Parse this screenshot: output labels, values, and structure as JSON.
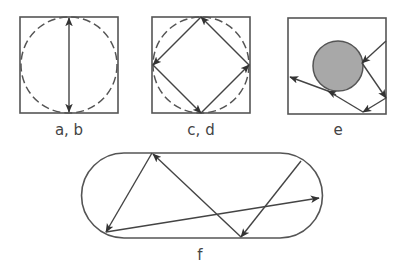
{
  "panels": [
    {
      "id": "ab",
      "label": "a, b",
      "description": "square with inscribed dashed circle, vertical double-headed arrow (diameter)"
    },
    {
      "id": "cd",
      "label": "c, d",
      "description": "square with inscribed dashed circle, inscribed diamond of arrows"
    },
    {
      "id": "e",
      "label": "e",
      "description": "square with grey filled circular scatterer and reflecting ray path"
    },
    {
      "id": "f",
      "label": "f",
      "description": "stadium billiard with chaotic ray trajectory"
    }
  ],
  "colors": {
    "stroke": "#555555",
    "scatterer_fill": "#a8a8a8",
    "background": "#ffffff"
  }
}
